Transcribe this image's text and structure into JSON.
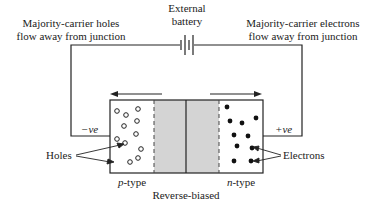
{
  "battery": {
    "label_line1": "External",
    "label_line2": "battery"
  },
  "left_caption": {
    "line1": "Majority-carrier holes",
    "line2": "flow away from junction"
  },
  "right_caption": {
    "line1": "Majority-carrier electrons",
    "line2": "flow away from junction"
  },
  "terminals": {
    "negative": "−ve",
    "positive": "+ve"
  },
  "regions": {
    "p_prefix": "p",
    "p_suffix": "-type",
    "n_prefix": "n",
    "n_suffix": "-type"
  },
  "labels": {
    "holes": "Holes",
    "electrons": "Electrons",
    "bias": "Reverse-biased"
  },
  "colors": {
    "line": "#222222",
    "depletion": "#d4d4d4",
    "background": "#ffffff"
  },
  "carriers": {
    "holes": [
      [
        117,
        111
      ],
      [
        126,
        115
      ],
      [
        138,
        109
      ],
      [
        124,
        126
      ],
      [
        137,
        121
      ],
      [
        117,
        139
      ],
      [
        136,
        134
      ],
      [
        141,
        149
      ],
      [
        125,
        143
      ],
      [
        130,
        162
      ],
      [
        138,
        158
      ]
    ],
    "electrons": [
      [
        227,
        107
      ],
      [
        230,
        121
      ],
      [
        242,
        123
      ],
      [
        256,
        118
      ],
      [
        234,
        135
      ],
      [
        248,
        136
      ],
      [
        237,
        146
      ],
      [
        252,
        148
      ],
      [
        234,
        161
      ],
      [
        251,
        161
      ]
    ]
  }
}
